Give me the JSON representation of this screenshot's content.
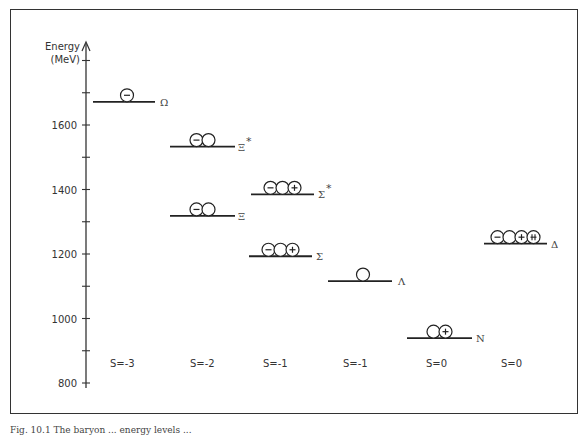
{
  "axis": {
    "label_line1": "Energy",
    "label_line2": "(MeV)",
    "ticks": [
      {
        "value": 1800,
        "label": ""
      },
      {
        "value": 1700,
        "label": ""
      },
      {
        "value": 1600,
        "label": "1600"
      },
      {
        "value": 1500,
        "label": ""
      },
      {
        "value": 1400,
        "label": "1400"
      },
      {
        "value": 1300,
        "label": ""
      },
      {
        "value": 1200,
        "label": "1200"
      },
      {
        "value": 1100,
        "label": ""
      },
      {
        "value": 1000,
        "label": "1000"
      },
      {
        "value": 900,
        "label": ""
      },
      {
        "value": 800,
        "label": "800"
      }
    ],
    "range": [
      800,
      1800
    ]
  },
  "levels": [
    {
      "name": "Ω",
      "symbol": "Ω",
      "energy": 1672,
      "x1": 93,
      "x2": 155,
      "label_x": 160,
      "charges": [
        "-"
      ]
    },
    {
      "name": "Ξ*",
      "symbol": "Ξ*",
      "energy": 1533,
      "x1": 170,
      "x2": 235,
      "label_x": 238,
      "charges": [
        "-",
        ""
      ]
    },
    {
      "name": "Ξ",
      "symbol": "Ξ",
      "energy": 1318,
      "x1": 170,
      "x2": 235,
      "label_x": 238,
      "charges": [
        "-",
        ""
      ]
    },
    {
      "name": "Σ*",
      "symbol": "Σ*",
      "energy": 1385,
      "x1": 251,
      "x2": 314,
      "label_x": 318,
      "charges": [
        "-",
        "",
        "+"
      ]
    },
    {
      "name": "Σ",
      "symbol": "Σ",
      "energy": 1193,
      "x1": 249,
      "x2": 312,
      "label_x": 316,
      "charges": [
        "-",
        "",
        "+"
      ]
    },
    {
      "name": "Λ",
      "symbol": "Λ",
      "energy": 1116,
      "x1": 328,
      "x2": 392,
      "label_x": 398,
      "charges": [
        ""
      ]
    },
    {
      "name": "N",
      "symbol": "N",
      "energy": 939,
      "x1": 407,
      "x2": 472,
      "label_x": 476,
      "charges": [
        "",
        "+"
      ]
    },
    {
      "name": "Δ",
      "symbol": "Δ",
      "energy": 1232,
      "x1": 484,
      "x2": 547,
      "label_x": 551,
      "charges": [
        "-",
        "",
        "+",
        "++"
      ]
    }
  ],
  "strangeness_labels": [
    {
      "label": "S=-3",
      "x": 110
    },
    {
      "label": "S=-2",
      "x": 190
    },
    {
      "label": "S=-1",
      "x": 263
    },
    {
      "label": "S=-1",
      "x": 343
    },
    {
      "label": "S=0",
      "x": 426
    },
    {
      "label": "S=0",
      "x": 501
    }
  ],
  "caption": "Fig. 10.1  The baryon ... energy levels ..."
}
